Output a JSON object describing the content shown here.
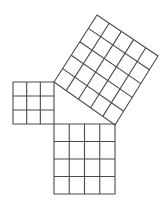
{
  "diagram": {
    "background": "#ffffff",
    "line_color": "#4a4a4a",
    "line_width": 1.1,
    "squares": [
      {
        "name": "small-square-3x3",
        "side_units": 3,
        "corners": [
          [
            13,
            82
          ],
          [
            54,
            82
          ],
          [
            54,
            124
          ],
          [
            13,
            124
          ]
        ]
      },
      {
        "name": "medium-square-4x4",
        "side_units": 4,
        "corners": [
          [
            54,
            124
          ],
          [
            115,
            124
          ],
          [
            115,
            194
          ],
          [
            54,
            194
          ]
        ]
      },
      {
        "name": "large-square-5x5",
        "side_units": 5,
        "corners": [
          [
            54,
            82
          ],
          [
            115,
            125
          ],
          [
            158,
            56
          ],
          [
            97,
            15
          ]
        ]
      }
    ]
  }
}
